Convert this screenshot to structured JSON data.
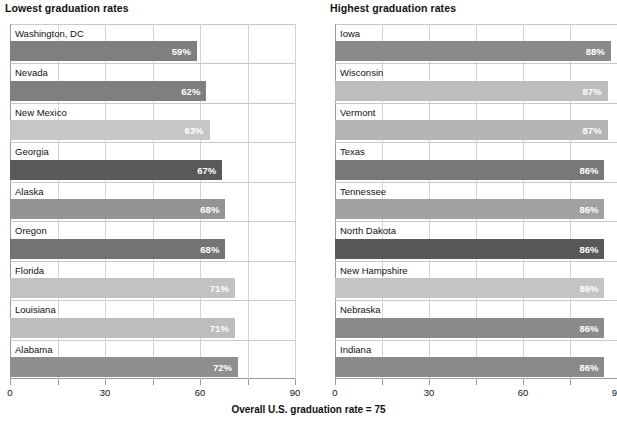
{
  "footer": {
    "text": "Overall U.S. graduation rate = 75"
  },
  "axis": {
    "tick_labels": [
      "0",
      "30",
      "60",
      "90"
    ],
    "tick_values": [
      0,
      15,
      30,
      45,
      60,
      75,
      90
    ],
    "labeled_values": [
      0,
      30,
      60,
      90
    ],
    "min": 0,
    "max": 90
  },
  "panels": [
    {
      "id": "lowest",
      "title": "Lowest graduation rates",
      "rows": [
        {
          "label": "Washington, DC",
          "value": 59,
          "value_label": "59%",
          "color": "#7f7f7f"
        },
        {
          "label": "Nevada",
          "value": 62,
          "value_label": "62%",
          "color": "#7f7f7f"
        },
        {
          "label": "New Mexico",
          "value": 63,
          "value_label": "63%",
          "color": "#c6c6c6"
        },
        {
          "label": "Georgia",
          "value": 67,
          "value_label": "67%",
          "color": "#595959"
        },
        {
          "label": "Alaska",
          "value": 68,
          "value_label": "68%",
          "color": "#949494"
        },
        {
          "label": "Oregon",
          "value": 68,
          "value_label": "68%",
          "color": "#737373"
        },
        {
          "label": "Florida",
          "value": 71,
          "value_label": "71%",
          "color": "#c2c2c2"
        },
        {
          "label": "Louisiana",
          "value": 71,
          "value_label": "71%",
          "color": "#bdbdbd"
        },
        {
          "label": "Alabama",
          "value": 72,
          "value_label": "72%",
          "color": "#8f8f8f"
        }
      ]
    },
    {
      "id": "highest",
      "title": "Highest graduation rates",
      "rows": [
        {
          "label": "Iowa",
          "value": 88,
          "value_label": "88%",
          "color": "#8a8a8a"
        },
        {
          "label": "Wisconsin",
          "value": 87,
          "value_label": "87%",
          "color": "#bdbdbd"
        },
        {
          "label": "Vermont",
          "value": 87,
          "value_label": "87%",
          "color": "#b5b5b5"
        },
        {
          "label": "Texas",
          "value": 86,
          "value_label": "86%",
          "color": "#787878"
        },
        {
          "label": "Tennessee",
          "value": 86,
          "value_label": "86%",
          "color": "#a1a1a1"
        },
        {
          "label": "North Dakota",
          "value": 86,
          "value_label": "86%",
          "color": "#585858"
        },
        {
          "label": "New Hampshire",
          "value": 86,
          "value_label": "86%",
          "color": "#c4c4c4"
        },
        {
          "label": "Nebraska",
          "value": 86,
          "value_label": "86%",
          "color": "#8a8a8a"
        },
        {
          "label": "Indiana",
          "value": 86,
          "value_label": "86%",
          "color": "#8a8a8a"
        }
      ]
    }
  ],
  "chart_data": {
    "type": "bar",
    "subtitle": "Overall U.S. graduation rate = 75",
    "orientation": "horizontal",
    "xlabel": "",
    "ylabel": "",
    "xlim": [
      0,
      90
    ],
    "xticks": [
      0,
      15,
      30,
      45,
      60,
      75,
      90
    ],
    "xtick_labels": [
      "0",
      "",
      "30",
      "",
      "60",
      "",
      "90"
    ],
    "grid": true,
    "legend": "none",
    "annotations": [
      "Overall U.S. graduation rate = 75"
    ],
    "panels": [
      {
        "title": "Lowest graduation rates",
        "categories": [
          "Washington, DC",
          "Nevada",
          "New Mexico",
          "Georgia",
          "Alaska",
          "Oregon",
          "Florida",
          "Louisiana",
          "Alabama"
        ],
        "values": [
          59,
          62,
          63,
          67,
          68,
          68,
          71,
          71,
          72
        ],
        "data_labels": [
          "59%",
          "62%",
          "63%",
          "67%",
          "68%",
          "68%",
          "71%",
          "71%",
          "72%"
        ]
      },
      {
        "title": "Highest graduation rates",
        "categories": [
          "Iowa",
          "Wisconsin",
          "Vermont",
          "Texas",
          "Tennessee",
          "North Dakota",
          "New Hampshire",
          "Nebraska",
          "Indiana"
        ],
        "values": [
          88,
          87,
          87,
          86,
          86,
          86,
          86,
          86,
          86
        ],
        "data_labels": [
          "88%",
          "87%",
          "87%",
          "86%",
          "86%",
          "86%",
          "86%",
          "86%",
          "86%"
        ]
      }
    ]
  }
}
